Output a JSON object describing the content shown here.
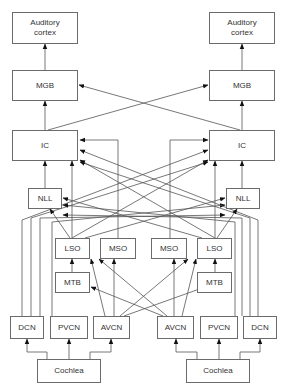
{
  "diagram": {
    "left": {
      "cortex": "Auditory\ncortex",
      "mgb": "MGB",
      "ic": "IC",
      "nll": "NLL",
      "lso": "LSO",
      "mso": "MSO",
      "mtb": "MTB",
      "dcn": "DCN",
      "pvcn": "PVCN",
      "avcn": "AVCN",
      "cochlea": "Cochlea"
    },
    "right": {
      "cortex": "Auditory\ncortex",
      "mgb": "MGB",
      "ic": "IC",
      "nll": "NLL",
      "lso": "LSO",
      "mso": "MSO",
      "mtb": "MTB",
      "dcn": "DCN",
      "pvcn": "PVCN",
      "avcn": "AVCN",
      "cochlea": "Cochlea"
    },
    "colors": {
      "line": "#555555",
      "box_border": "#6b6b6b",
      "text": "#333333"
    }
  }
}
